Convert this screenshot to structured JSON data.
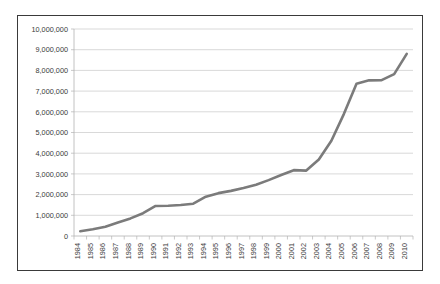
{
  "chart_data": {
    "type": "line",
    "title": "",
    "subtitle": "",
    "xlabel": "",
    "ylabel": "",
    "grid": true,
    "legend": false,
    "legend_position": "none",
    "line_color": "#7b7b7b",
    "axis_color": "#b3b3b3",
    "grid_color": "#c9c9c9",
    "border_color": "#3a3a3a",
    "ylim": [
      0,
      10000000
    ],
    "ytick_values": [
      0,
      1000000,
      2000000,
      3000000,
      4000000,
      5000000,
      6000000,
      7000000,
      8000000,
      9000000,
      10000000
    ],
    "ytick_labels": [
      "0",
      "1,000,000",
      "2,000,000",
      "3,000,000",
      "4,000,000",
      "5,000,000",
      "6,000,000",
      "7,000,000",
      "8,000,000",
      "9,000,000",
      "10,000,000"
    ],
    "categories": [
      "1984",
      "1985",
      "1986",
      "1987",
      "1988",
      "1989",
      "1990",
      "1991",
      "1992",
      "1993",
      "1994",
      "1995",
      "1996",
      "1997",
      "1998",
      "1999",
      "2000",
      "2001",
      "2002",
      "2003",
      "2004",
      "2005",
      "2006",
      "2007",
      "2008",
      "2009",
      "2010"
    ],
    "values": [
      230000,
      330000,
      450000,
      650000,
      850000,
      1100000,
      1450000,
      1460000,
      1500000,
      1560000,
      1900000,
      2070000,
      2180000,
      2320000,
      2480000,
      2700000,
      2950000,
      3180000,
      3160000,
      3700000,
      4600000,
      5900000,
      7350000,
      7520000,
      7530000,
      7820000,
      8800000
    ]
  }
}
